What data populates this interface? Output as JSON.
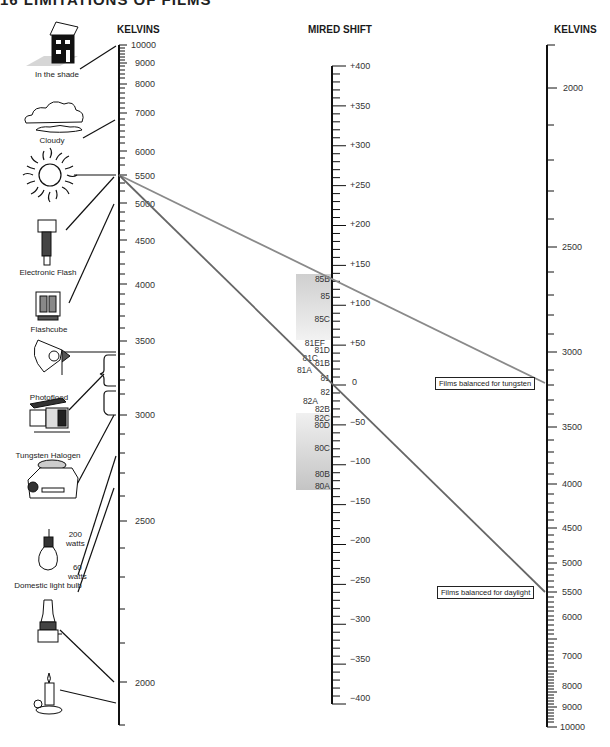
{
  "page": {
    "heading": "16 LIMITATIONS OF FILMS"
  },
  "columns": {
    "left_title": "KELVINS",
    "middle_title": "MIRED SHIFT",
    "right_title": "KELVINS"
  },
  "light_sources": [
    {
      "label": "In the shade",
      "kelvin": 10000
    },
    {
      "label": "Cloudy",
      "kelvin": 7500
    },
    {
      "label": "",
      "kelvin": 5500,
      "icon": "sun"
    },
    {
      "label": "Electronic Flash",
      "kelvin": 5500
    },
    {
      "label": "Flashcube",
      "kelvin": 5000
    },
    {
      "label": "Photoflood",
      "kelvin": 3400
    },
    {
      "label": "Tungsten Halogen",
      "kelvin": 3200
    },
    {
      "label": "",
      "kelvin": 2800,
      "icon": "projector"
    },
    {
      "label": "Domestic light bulb",
      "kelvin": 2700
    },
    {
      "label": "",
      "kelvin": 2000,
      "icon": "oil-lamp"
    },
    {
      "label": "",
      "kelvin": 1900,
      "icon": "candle"
    }
  ],
  "bulb_wattages": [
    {
      "label": "200\nwatts"
    },
    {
      "label": "60\nwatts"
    }
  ],
  "bulb_labels": {
    "w200": "200",
    "watts": "watts",
    "w60": "60"
  },
  "film_labels": {
    "tungsten": "Films balanced for tungsten",
    "daylight": "Films balanced for daylight"
  },
  "chart_data": {
    "type": "nomogram",
    "scales": [
      {
        "name": "Source KELVINS (left)",
        "major_ticks": [
          10000,
          9000,
          8000,
          7000,
          6000,
          5500,
          5000,
          4500,
          4000,
          3500,
          3000,
          2500,
          2000
        ]
      },
      {
        "name": "MIRED SHIFT (middle)",
        "major_ticks": [
          "+400",
          "+350",
          "+300",
          "+250",
          "+200",
          "+150",
          "+100",
          "+50",
          "0",
          "-50",
          "-100",
          "-150",
          "-200",
          "-250",
          "-300",
          "-350",
          "-400"
        ]
      },
      {
        "name": "Film KELVINS (right)",
        "major_ticks": [
          2000,
          2500,
          3000,
          3500,
          4000,
          4500,
          5000,
          5500,
          6000,
          7000,
          8000,
          9000,
          10000
        ]
      }
    ],
    "filters_warming": [
      "85B",
      "85",
      "85C",
      "81EF",
      "81D",
      "81C",
      "81B",
      "81A",
      "81"
    ],
    "filters_cooling": [
      "82",
      "82A",
      "82B",
      "82C",
      "80D",
      "80C",
      "80B",
      "80A"
    ],
    "example_lines": [
      {
        "from_kelvin": 5500,
        "to_film": "tungsten (3200K)",
        "mired_shift": "+131 (85B)"
      },
      {
        "from_kelvin": 5500,
        "to_film": "daylight (5500K)",
        "mired_shift": "0"
      }
    ]
  }
}
